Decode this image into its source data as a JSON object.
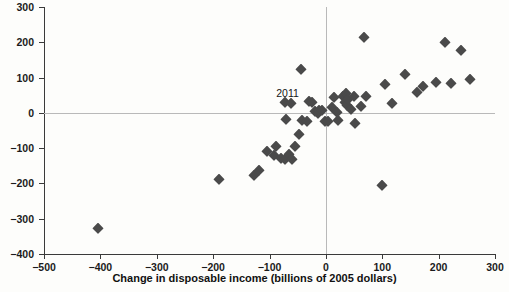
{
  "chart_data": {
    "type": "scatter",
    "title": "",
    "xlabel": "Change in disposable income (billions of 2005 dollars)",
    "ylabel": "Change in consumption (billions of 2005 dollars)",
    "xlim": [
      -500,
      300
    ],
    "ylim": [
      -400,
      300
    ],
    "xticks": [
      -500,
      -400,
      -300,
      -200,
      -100,
      0,
      100,
      200,
      300
    ],
    "xtick_labels": [
      "−500",
      "−400",
      "−300",
      "−200",
      "−100",
      "0",
      "100",
      "200",
      "300"
    ],
    "yticks": [
      -400,
      -300,
      -200,
      -100,
      0,
      100,
      200,
      300
    ],
    "ytick_labels": [
      "−400",
      "−300",
      "−200",
      "−100",
      "0",
      "100",
      "200",
      "300"
    ],
    "grid": false,
    "legend": null,
    "marker": "diamond",
    "marker_color": "#4a4a4a",
    "zero_lines": {
      "x": 0,
      "y": 0,
      "color": "#b9b9b9"
    },
    "annotations": [
      {
        "text": "2011",
        "x": -68,
        "y": 57
      }
    ],
    "points": [
      {
        "x": -405,
        "y": -327
      },
      {
        "x": -190,
        "y": -187
      },
      {
        "x": -128,
        "y": -175
      },
      {
        "x": -118,
        "y": -162
      },
      {
        "x": -105,
        "y": -108
      },
      {
        "x": -92,
        "y": -120
      },
      {
        "x": -88,
        "y": -95
      },
      {
        "x": -80,
        "y": -128
      },
      {
        "x": -72,
        "y": -132
      },
      {
        "x": -66,
        "y": -118
      },
      {
        "x": -60,
        "y": -130
      },
      {
        "x": -55,
        "y": -95
      },
      {
        "x": -48,
        "y": -60
      },
      {
        "x": -44,
        "y": 125
      },
      {
        "x": -72,
        "y": 30
      },
      {
        "x": -62,
        "y": 28
      },
      {
        "x": -70,
        "y": -18
      },
      {
        "x": -42,
        "y": -20
      },
      {
        "x": -34,
        "y": -22
      },
      {
        "x": -30,
        "y": 33
      },
      {
        "x": -24,
        "y": 30
      },
      {
        "x": -20,
        "y": 5
      },
      {
        "x": -14,
        "y": 0
      },
      {
        "x": -12,
        "y": 8
      },
      {
        "x": -6,
        "y": 7
      },
      {
        "x": -2,
        "y": -22
      },
      {
        "x": 4,
        "y": -24
      },
      {
        "x": 10,
        "y": 18
      },
      {
        "x": 14,
        "y": 44
      },
      {
        "x": 20,
        "y": 2
      },
      {
        "x": 22,
        "y": -20
      },
      {
        "x": 30,
        "y": 48
      },
      {
        "x": 34,
        "y": 30
      },
      {
        "x": 36,
        "y": 55
      },
      {
        "x": 38,
        "y": 22
      },
      {
        "x": 40,
        "y": 40
      },
      {
        "x": 44,
        "y": 10
      },
      {
        "x": 50,
        "y": 48
      },
      {
        "x": 52,
        "y": -28
      },
      {
        "x": 62,
        "y": 20
      },
      {
        "x": 68,
        "y": 215
      },
      {
        "x": 72,
        "y": 48
      },
      {
        "x": 100,
        "y": -205
      },
      {
        "x": 105,
        "y": 82
      },
      {
        "x": 118,
        "y": 28
      },
      {
        "x": 140,
        "y": 110
      },
      {
        "x": 162,
        "y": 58
      },
      {
        "x": 172,
        "y": 75
      },
      {
        "x": 196,
        "y": 88
      },
      {
        "x": 212,
        "y": 200
      },
      {
        "x": 222,
        "y": 85
      },
      {
        "x": 240,
        "y": 178
      },
      {
        "x": 255,
        "y": 95
      }
    ]
  }
}
